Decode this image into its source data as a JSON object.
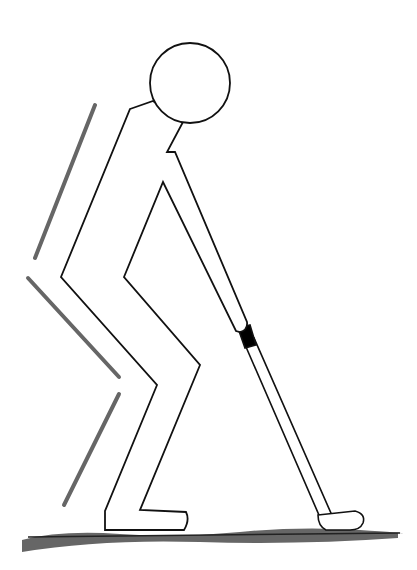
{
  "illustration": {
    "subject": "golfer stick figure in putting stance",
    "colors": {
      "outline": "#111111",
      "motion_lines": "#666666",
      "ground": "#555555",
      "grip": "#000000",
      "background": "#ffffff"
    }
  }
}
